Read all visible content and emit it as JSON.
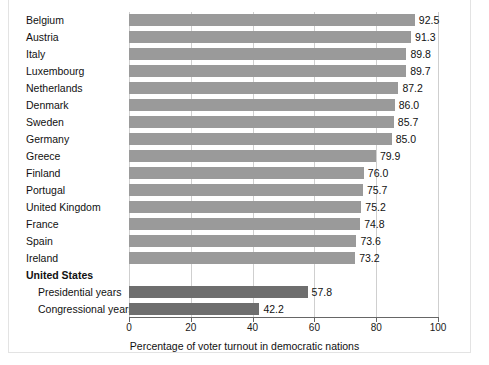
{
  "chart_data": {
    "type": "bar",
    "orientation": "horizontal",
    "title": "",
    "xlabel": "Percentage of voter turnout in democratic nations",
    "ylabel": "",
    "xlim": [
      0,
      100
    ],
    "xticks": [
      0,
      20,
      40,
      60,
      80,
      100
    ],
    "xtick_labels": [
      "0",
      "20",
      "40",
      "60",
      "80",
      "100"
    ],
    "grid": true,
    "legend": "none",
    "categories": [
      "Belgium",
      "Austria",
      "Italy",
      "Luxembourg",
      "Netherlands",
      "Denmark",
      "Sweden",
      "Germany",
      "Greece",
      "Finland",
      "Portugal",
      "United Kingdom",
      "France",
      "Spain",
      "Ireland",
      "United States",
      "Presidential years",
      "Congressional years"
    ],
    "values": [
      92.5,
      91.3,
      89.8,
      89.7,
      87.2,
      86.0,
      85.7,
      85.0,
      79.9,
      76.0,
      75.7,
      75.2,
      74.8,
      73.6,
      73.2,
      null,
      57.8,
      42.2
    ],
    "value_labels": [
      "92.5",
      "91.3",
      "89.8",
      "89.7",
      "87.2",
      "86.0",
      "85.7",
      "85.0",
      "79.9",
      "76.0",
      "75.7",
      "75.2",
      "74.8",
      "73.6",
      "73.2",
      "",
      "57.8",
      "42.2"
    ],
    "rows": [
      {
        "label": "Belgium",
        "value": 92.5,
        "value_label": "92.5",
        "style": "light",
        "indent": false,
        "bold": false
      },
      {
        "label": "Austria",
        "value": 91.3,
        "value_label": "91.3",
        "style": "light",
        "indent": false,
        "bold": false
      },
      {
        "label": "Italy",
        "value": 89.8,
        "value_label": "89.8",
        "style": "light",
        "indent": false,
        "bold": false
      },
      {
        "label": "Luxembourg",
        "value": 89.7,
        "value_label": "89.7",
        "style": "light",
        "indent": false,
        "bold": false
      },
      {
        "label": "Netherlands",
        "value": 87.2,
        "value_label": "87.2",
        "style": "light",
        "indent": false,
        "bold": false
      },
      {
        "label": "Denmark",
        "value": 86.0,
        "value_label": "86.0",
        "style": "light",
        "indent": false,
        "bold": false
      },
      {
        "label": "Sweden",
        "value": 85.7,
        "value_label": "85.7",
        "style": "light",
        "indent": false,
        "bold": false
      },
      {
        "label": "Germany",
        "value": 85.0,
        "value_label": "85.0",
        "style": "light",
        "indent": false,
        "bold": false
      },
      {
        "label": "Greece",
        "value": 79.9,
        "value_label": "79.9",
        "style": "light",
        "indent": false,
        "bold": false
      },
      {
        "label": "Finland",
        "value": 76.0,
        "value_label": "76.0",
        "style": "light",
        "indent": false,
        "bold": false
      },
      {
        "label": "Portugal",
        "value": 75.7,
        "value_label": "75.7",
        "style": "light",
        "indent": false,
        "bold": false
      },
      {
        "label": "United Kingdom",
        "value": 75.2,
        "value_label": "75.2",
        "style": "light",
        "indent": false,
        "bold": false
      },
      {
        "label": "France",
        "value": 74.8,
        "value_label": "74.8",
        "style": "light",
        "indent": false,
        "bold": false
      },
      {
        "label": "Spain",
        "value": 73.6,
        "value_label": "73.6",
        "style": "light",
        "indent": false,
        "bold": false
      },
      {
        "label": "Ireland",
        "value": 73.2,
        "value_label": "73.2",
        "style": "light",
        "indent": false,
        "bold": false
      },
      {
        "label": "United States",
        "value": null,
        "value_label": "",
        "style": "none",
        "indent": false,
        "bold": true
      },
      {
        "label": "Presidential years",
        "value": 57.8,
        "value_label": "57.8",
        "style": "dark",
        "indent": true,
        "bold": false
      },
      {
        "label": "Congressional years",
        "value": 42.2,
        "value_label": "42.2",
        "style": "dark",
        "indent": true,
        "bold": false
      }
    ],
    "colors": {
      "bar_light": "#9a9a9a",
      "bar_dark": "#6e6e6e",
      "grid": "#cfcfcf",
      "axis": "#666666",
      "text": "#111111",
      "background": "#ffffff"
    }
  }
}
